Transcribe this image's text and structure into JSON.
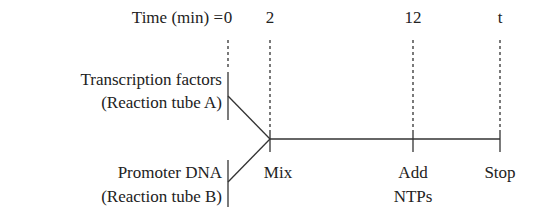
{
  "diagram": {
    "time_label": "Time (min) =",
    "timepoints": [
      {
        "label": "0",
        "x": 228
      },
      {
        "label": "2",
        "x": 270
      },
      {
        "label": "12",
        "x": 413
      },
      {
        "label": "t",
        "x": 500
      }
    ],
    "inputs": [
      {
        "line1": "Transcription factors",
        "line2": "(Reaction tube A)"
      },
      {
        "line1": "Promoter DNA",
        "line2": "(Reaction tube B)"
      }
    ],
    "events": [
      {
        "line1": "Mix",
        "line2": ""
      },
      {
        "line1": "Add",
        "line2": "NTPs"
      },
      {
        "line1": "Stop",
        "line2": ""
      }
    ]
  }
}
